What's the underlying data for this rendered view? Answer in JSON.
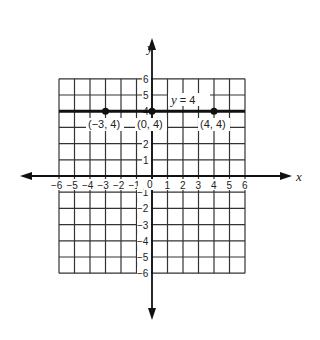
{
  "chart_data": {
    "type": "line",
    "title": "",
    "xlabel": "x",
    "ylabel": "y",
    "xlim": [
      -6,
      6
    ],
    "ylim": [
      -6,
      6
    ],
    "grid": true,
    "x_ticks": [
      "-6",
      "-5",
      "-4",
      "-3",
      "-2",
      "-1",
      "0",
      "1",
      "2",
      "3",
      "4",
      "5",
      "6"
    ],
    "y_ticks": [
      "6",
      "5",
      "4",
      "3",
      "2",
      "1",
      "-1",
      "-2",
      "-3",
      "-4",
      "-5",
      "-6"
    ],
    "series": [
      {
        "name": "y = 4",
        "equation": "y = 4",
        "x": [
          -6,
          6
        ],
        "y": [
          4,
          4
        ]
      }
    ],
    "points": [
      {
        "x": -3,
        "y": 4,
        "label": "(-3, 4)"
      },
      {
        "x": 0,
        "y": 4,
        "label": "(0, 4)"
      },
      {
        "x": 4,
        "y": 4,
        "label": "(4, 4)"
      }
    ],
    "annotations": [
      {
        "text": "y = 4",
        "x": 1.6,
        "y": 4.5
      }
    ]
  },
  "labels": {
    "x_axis": "x",
    "y_axis": "y",
    "equation": "y  =  4",
    "equation_var": "y",
    "equation_rest": " = 4",
    "pt1": "(−3, 4)",
    "pt2": "(0, 4)",
    "pt3": "(4, 4)",
    "origin": "0"
  },
  "ticks": {
    "x": [
      "−6",
      "−5",
      "−4",
      "−3",
      "−2",
      "−1",
      "1",
      "2",
      "3",
      "4",
      "5",
      "6"
    ],
    "y_pos": [
      "1",
      "2",
      "3",
      "4",
      "5",
      "6"
    ],
    "y_neg": [
      "−1",
      "−2",
      "−3",
      "−4",
      "−5",
      "−6"
    ]
  }
}
